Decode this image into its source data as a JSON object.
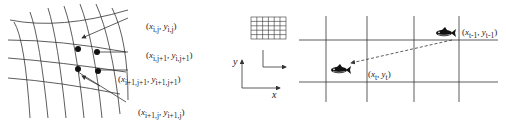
{
  "left_panel": {
    "description": "Curvilinear mesh grid with highlighted cell nodes",
    "labels": [
      {
        "id": "node_i_j",
        "text": "(x_{i,j}, y_{i,j})",
        "x": "x",
        "xs": "i,j",
        "y": "y",
        "ys": "i,j"
      },
      {
        "id": "node_i_j1",
        "text": "(x_{i,j+1}, y_{i,j+1})",
        "x": "x",
        "xs": "i,j+1",
        "y": "y",
        "ys": "i,j+1"
      },
      {
        "id": "node_i1_j1",
        "text": "(x_{i+1,j+1}, y_{i+1,j+1})",
        "x": "x",
        "xs": "i+1,j+1",
        "y": "y",
        "ys": "i+1,j+1"
      },
      {
        "id": "node_i1_j",
        "text": "(x_{i+1,j}, y_{i+1,j})",
        "x": "x",
        "xs": "i+1,j",
        "y": "y",
        "ys": "i+1,j"
      }
    ]
  },
  "middle_panel": {
    "axis_x": "x",
    "axis_y": "y"
  },
  "right_panel": {
    "description": "Fish moving between grid cells",
    "labels": [
      {
        "id": "fish_prev",
        "text": "(x_{t-1}, y_{t-1})",
        "x": "x",
        "xs": "t-1",
        "y": "y",
        "ys": "t-1"
      },
      {
        "id": "fish_curr",
        "text": "(x_t, y_t)",
        "x": "x",
        "xs": "t",
        "y": "y",
        "ys": "t"
      }
    ]
  },
  "colors": {
    "line": "#333333",
    "background": "#ffffff"
  }
}
